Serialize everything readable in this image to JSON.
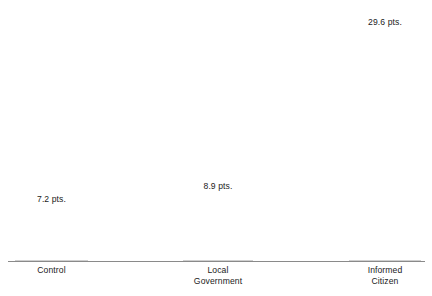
{
  "chart_data": {
    "type": "bar",
    "title": "",
    "subtitle": "",
    "xlabel": "",
    "ylabel": "",
    "categories": [
      "Control",
      "Local Government",
      "Informed Citizen"
    ],
    "category_lines": [
      [
        "Control"
      ],
      [
        "Local",
        "Government"
      ],
      [
        "Informed",
        "Citizen"
      ]
    ],
    "values": [
      7.2,
      8.9,
      29.6
    ],
    "value_labels": [
      "7.2 pts.",
      "8.9 pts.",
      "29.6 pts."
    ],
    "unit": "pts.",
    "ylim": [
      0,
      33.2
    ],
    "grid": false,
    "legend": null,
    "legend_position": "none",
    "axis_visible": {
      "x": true,
      "y": false
    },
    "annotations": []
  },
  "style": {
    "bar_fill": "#d6d6d6",
    "bar_stroke": "#cfcfcf",
    "axis_color": "#8a8a8a",
    "text_color": "#1b1b1b",
    "background": "#ffffff"
  },
  "bars": [
    {
      "name": "control",
      "value_label": "7.2 pts.",
      "category_line_1": "Control",
      "category_line_2": ""
    },
    {
      "name": "local-government",
      "value_label": "8.9 pts.",
      "category_line_1": "Local",
      "category_line_2": "Government"
    },
    {
      "name": "informed-citizen",
      "value_label": "29.6 pts.",
      "category_line_1": "Informed",
      "category_line_2": "Citizen"
    }
  ]
}
